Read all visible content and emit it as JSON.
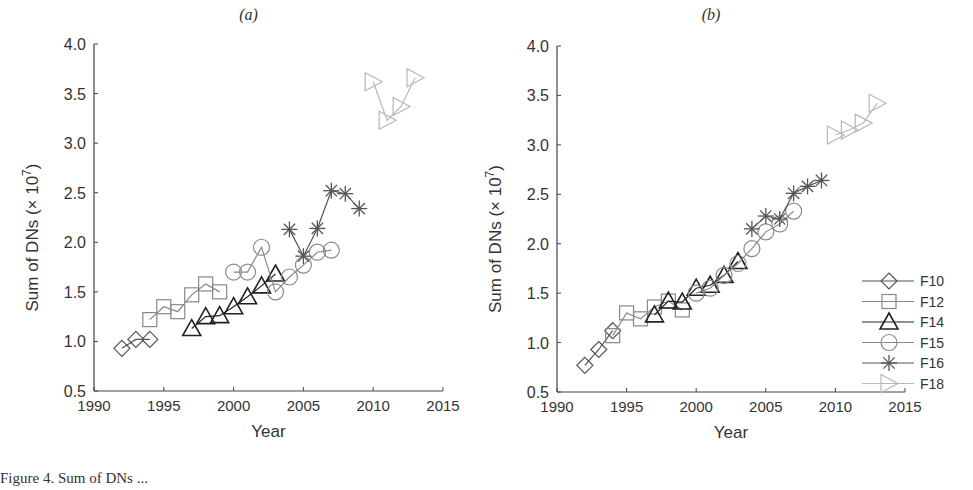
{
  "figure": {
    "caption_fragment": "Figure 4. Sum of DNs ..."
  },
  "chart_data": [
    {
      "type": "line",
      "panel_label": "(a)",
      "title": "(a)",
      "xlabel": "Year",
      "ylabel": "Sum of DNs (× 10^7)",
      "xlim": [
        1990,
        2015
      ],
      "ylim": [
        0.5,
        4.0
      ],
      "xticks": [
        1990,
        1995,
        2000,
        2005,
        2010,
        2015
      ],
      "yticks": [
        0.5,
        1.0,
        1.5,
        2.0,
        2.5,
        3.0,
        3.5,
        4.0
      ],
      "grid": false,
      "legend": false,
      "series": [
        {
          "name": "F10",
          "marker": "diamond",
          "color": "#555555",
          "x": [
            1992,
            1993,
            1994
          ],
          "y": [
            0.93,
            1.02,
            1.02
          ]
        },
        {
          "name": "F12",
          "marker": "square",
          "color": "#888888",
          "x": [
            1994,
            1995,
            1996,
            1997,
            1998,
            1999
          ],
          "y": [
            1.22,
            1.35,
            1.3,
            1.47,
            1.58,
            1.5
          ]
        },
        {
          "name": "F14",
          "marker": "triangle-up",
          "color": "#222222",
          "x": [
            1997,
            1998,
            1999,
            2000,
            2001,
            2002,
            2003
          ],
          "y": [
            1.13,
            1.25,
            1.26,
            1.35,
            1.45,
            1.56,
            1.68
          ]
        },
        {
          "name": "F15",
          "marker": "circle",
          "color": "#8a8a8a",
          "x": [
            2000,
            2001,
            2002,
            2003,
            2004,
            2005,
            2006,
            2007
          ],
          "y": [
            1.7,
            1.7,
            1.95,
            1.5,
            1.65,
            1.77,
            1.9,
            1.92
          ]
        },
        {
          "name": "F16",
          "marker": "star",
          "color": "#555555",
          "x": [
            2004,
            2005,
            2006,
            2007,
            2008,
            2009
          ],
          "y": [
            2.13,
            1.86,
            2.14,
            2.52,
            2.49,
            2.34
          ]
        },
        {
          "name": "F18",
          "marker": "triangle-right",
          "color": "#b8b8b8",
          "x": [
            2010,
            2011,
            2012,
            2013
          ],
          "y": [
            3.62,
            3.23,
            3.37,
            3.66
          ]
        }
      ]
    },
    {
      "type": "line",
      "panel_label": "(b)",
      "title": "(b)",
      "xlabel": "Year",
      "ylabel": "Sum of DNs (× 10^7)",
      "xlim": [
        1990,
        2015
      ],
      "ylim": [
        0.5,
        4.0
      ],
      "xticks": [
        1990,
        1995,
        2000,
        2005,
        2010,
        2015
      ],
      "yticks": [
        0.5,
        1.0,
        1.5,
        2.0,
        2.5,
        3.0,
        3.5,
        4.0
      ],
      "grid": false,
      "legend": true,
      "legend_position": "lower right",
      "legend_entries": [
        "F10",
        "F12",
        "F14",
        "F15",
        "F16",
        "F18"
      ],
      "series": [
        {
          "name": "F10",
          "marker": "diamond",
          "color": "#555555",
          "x": [
            1992,
            1993,
            1994
          ],
          "y": [
            0.77,
            0.93,
            1.12
          ]
        },
        {
          "name": "F12",
          "marker": "square",
          "color": "#888888",
          "x": [
            1994,
            1995,
            1996,
            1997,
            1998,
            1999
          ],
          "y": [
            1.07,
            1.3,
            1.24,
            1.36,
            1.42,
            1.33
          ]
        },
        {
          "name": "F14",
          "marker": "triangle-up",
          "color": "#222222",
          "x": [
            1997,
            1998,
            1999,
            2000,
            2001,
            2002,
            2003
          ],
          "y": [
            1.28,
            1.42,
            1.41,
            1.55,
            1.58,
            1.68,
            1.82
          ]
        },
        {
          "name": "F15",
          "marker": "circle",
          "color": "#8a8a8a",
          "x": [
            2000,
            2001,
            2002,
            2003,
            2004,
            2005,
            2006,
            2007
          ],
          "y": [
            1.5,
            1.55,
            1.68,
            1.8,
            1.95,
            2.12,
            2.2,
            2.33
          ]
        },
        {
          "name": "F16",
          "marker": "star",
          "color": "#555555",
          "x": [
            2004,
            2005,
            2006,
            2007,
            2008,
            2009
          ],
          "y": [
            2.15,
            2.28,
            2.25,
            2.51,
            2.58,
            2.64
          ]
        },
        {
          "name": "F18",
          "marker": "triangle-right",
          "color": "#b8b8b8",
          "x": [
            2010,
            2011,
            2012,
            2013
          ],
          "y": [
            3.1,
            3.15,
            3.22,
            3.42
          ]
        }
      ]
    }
  ],
  "layout": {
    "panels": [
      {
        "x0": 94,
        "x1": 443,
        "y0": 391,
        "y1": 44
      },
      {
        "x0": 557,
        "x1": 905,
        "y0": 392,
        "y1": 46
      }
    ]
  }
}
